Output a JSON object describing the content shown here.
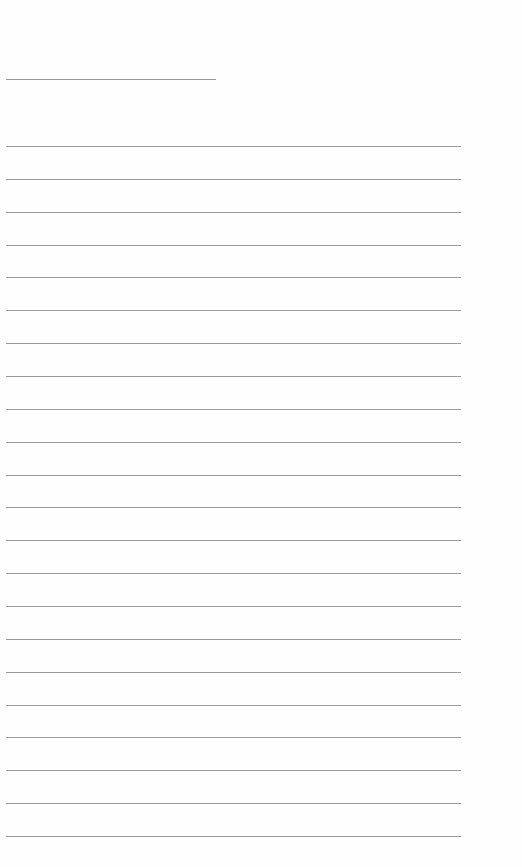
{
  "page": {
    "type": "lined-paper",
    "background": "#fefefe",
    "line_color": "#9a9a9a",
    "header_line": {
      "x": 6,
      "y": 79,
      "width": 210
    },
    "ruled_lines": {
      "count": 22,
      "x": 6,
      "width": 455,
      "first_y": 146,
      "spacing": 32.86
    }
  }
}
